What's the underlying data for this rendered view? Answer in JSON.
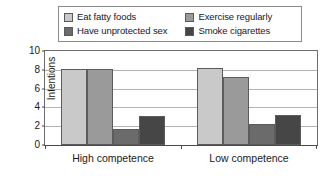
{
  "chart_data": {
    "type": "bar",
    "title": "",
    "xlabel": "",
    "ylabel": "Intentions",
    "ylim": [
      0,
      10
    ],
    "yticks": [
      0,
      2,
      4,
      6,
      8,
      10
    ],
    "grid": true,
    "legend_position": "top",
    "categories": [
      "High competence",
      "Low competence"
    ],
    "series": [
      {
        "name": "Eat fatty foods",
        "color": "#c9c9c9",
        "values": [
          8.1,
          8.2
        ]
      },
      {
        "name": "Exercise regularly",
        "color": "#9a9a9a",
        "values": [
          8.1,
          7.2
        ]
      },
      {
        "name": "Have unprotected sex",
        "color": "#6b6b6b",
        "values": [
          1.7,
          2.2
        ]
      },
      {
        "name": "Smoke cigarettes",
        "color": "#464646",
        "values": [
          3.1,
          3.2
        ]
      }
    ]
  },
  "legend": {
    "entries": [
      {
        "label": "Eat fatty foods"
      },
      {
        "label": "Exercise regularly"
      },
      {
        "label": "Have unprotected sex"
      },
      {
        "label": "Smoke cigarettes"
      }
    ]
  },
  "axes": {
    "y_title": "Intentions",
    "y_tick_labels": [
      "10",
      "8",
      "6",
      "4",
      "2",
      "0"
    ],
    "x_tick_labels": [
      "High competence",
      "Low competence"
    ]
  }
}
